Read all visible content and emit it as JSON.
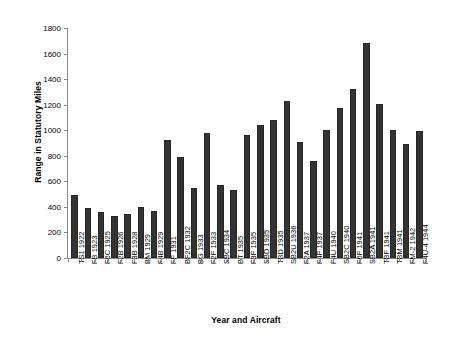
{
  "chart_data": {
    "type": "bar",
    "title": "",
    "xlabel": "Year and Aircraft",
    "ylabel": "Range in Statutory Miles",
    "ylim": [
      0,
      1800
    ],
    "yticks": [
      0,
      200,
      400,
      600,
      800,
      1000,
      1200,
      1400,
      1600,
      1800
    ],
    "grid": false,
    "legend": null,
    "bar_color": "#333333",
    "categories": [
      "TS1 1922",
      "FB 1923",
      "F6C 1925",
      "F2B 1926",
      "F3B 1928",
      "BM 1929",
      "F4B 1929",
      "FF 1931",
      "BF2C 1932",
      "BG 1933",
      "F2F 1933",
      "SBC 1934",
      "BT 1935",
      "F3F 1935",
      "SBD 1935",
      "TBD 1935",
      "SB2U 1936",
      "F2A 1937",
      "F4F 1937",
      "F4U 1940",
      "SB2C 1940",
      "F6F 1941",
      "SB2A 1941",
      "TBF 1941",
      "TBM 1941",
      "FM-2 1942",
      "F4U-4 1944"
    ],
    "values": [
      490,
      390,
      360,
      330,
      345,
      400,
      370,
      920,
      790,
      545,
      975,
      575,
      535,
      960,
      1040,
      1080,
      1230,
      905,
      760,
      1005,
      1175,
      1325,
      1680,
      1205,
      1000,
      895,
      995
    ]
  }
}
